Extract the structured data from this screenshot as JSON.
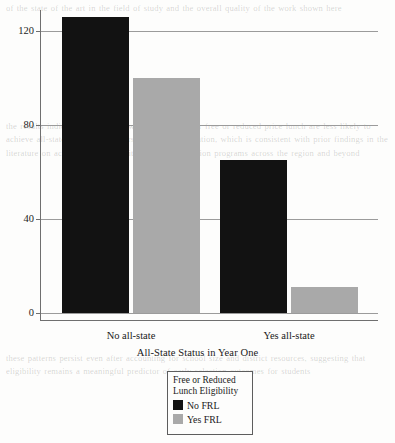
{
  "chart_data": {
    "type": "bar",
    "title": "",
    "xlabel": "All-State Status in Year One",
    "ylabel": "Frequency",
    "categories": [
      "No all-state",
      "Yes all-state"
    ],
    "series": [
      {
        "name": "No FRL",
        "color": "#121212",
        "values": [
          126,
          65
        ]
      },
      {
        "name": "Yes FRL",
        "color": "#a9a9a9",
        "values": [
          100,
          11
        ]
      }
    ],
    "ylim": [
      0,
      133
    ],
    "yticks": [
      0,
      40,
      80,
      120
    ],
    "ytick_labels": [
      "0",
      "40",
      "80",
      "120"
    ],
    "grid": "horizontal",
    "legend_position": "below-axes-center",
    "legend_title": "Free or Reduced\nLunch Eligibility"
  },
  "axes": {
    "y_label": "Frequency",
    "x_label": "All-State Status in Year One",
    "y_ticks": [
      "120",
      "80",
      "40",
      "0"
    ],
    "x_ticks": [
      "No all-state",
      "Yes all-state"
    ]
  },
  "legend": {
    "title": "Free or Reduced\nLunch Eligibility",
    "items": [
      {
        "label": "No FRL",
        "color": "#121212"
      },
      {
        "label": "Yes FRL",
        "color": "#a9a9a9"
      }
    ]
  },
  "background_text": {
    "top": "of the state of the art in the field of study and the overall quality of the work shown here",
    "middle": "the results indicate that students who are eligible for free or reduced price lunch are less likely to achieve all-state status in their first year of participation, which is consistent with prior findings in the literature on access and opportunity in music education programs across the region and beyond",
    "bottom": "these patterns persist even after accounting for school size and district resources, suggesting that eligibility remains a meaningful predictor of early selection outcomes for students"
  }
}
